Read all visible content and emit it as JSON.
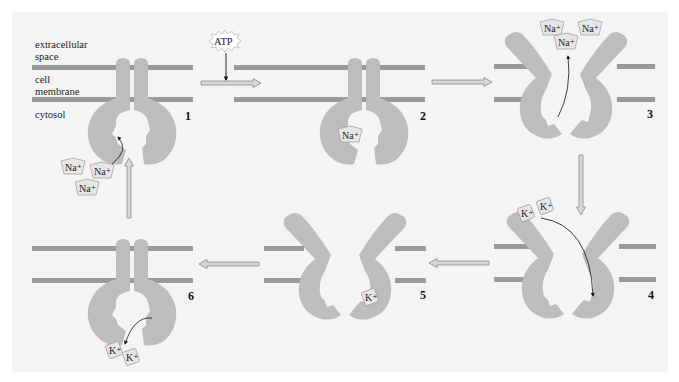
{
  "figure": {
    "labels": {
      "extracellular_line1": "extracellular",
      "extracellular_line2": "space",
      "membrane_line1": "cell",
      "membrane_line2": "membrane",
      "cytosol": "cytosol"
    },
    "atp_label": "ATP",
    "ions": {
      "sodium": "Na⁺",
      "potassium": "K⁺"
    },
    "steps": [
      {
        "number": "1",
        "description": "Pump open to cytosol; three Na+ ions bind"
      },
      {
        "number": "2",
        "description": "ATP phosphorylates pump; Na+ bound"
      },
      {
        "number": "3",
        "description": "Pump opens outward; Na+ released to extracellular space"
      },
      {
        "number": "4",
        "description": "Two K+ ions bind from extracellular space"
      },
      {
        "number": "5",
        "description": "K+ bound; pump closes"
      },
      {
        "number": "6",
        "description": "Pump opens to cytosol; K+ released"
      }
    ],
    "colors": {
      "panel_bg": "#f4f4f4",
      "membrane": "#9a9a9a",
      "protein": "#bdbdbd",
      "arrow_fill": "#d7d7d7",
      "arrow_stroke": "#8a8a8a",
      "ion_fill": "#e6e6e6",
      "text": "#222222"
    }
  }
}
